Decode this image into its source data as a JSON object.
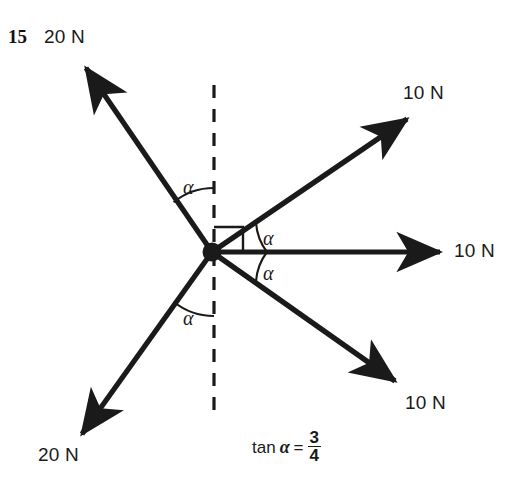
{
  "figure": {
    "question_number": "15",
    "width": 508,
    "height": 484,
    "background": "#ffffff",
    "ink_color": "#1a1a1a",
    "origin": {
      "x": 212,
      "y": 252
    }
  },
  "reference_line": {
    "name": "vertical-dashed-reference",
    "x": 214,
    "y_top": 85,
    "y_bottom": 420,
    "style": "dashed"
  },
  "right_angle_marker": {
    "present": true,
    "size": 28,
    "description": "square marker between vertical dashed line and upper-right 10 N vector"
  },
  "vectors": [
    {
      "id": "upper-left-20n",
      "label": "20 N",
      "magnitude": 20,
      "unit": "N",
      "tip": {
        "x": 80,
        "y": 62
      },
      "label_pos": {
        "x": 44,
        "y": 28
      }
    },
    {
      "id": "upper-right-10n",
      "label": "10 N",
      "magnitude": 10,
      "unit": "N",
      "tip": {
        "x": 412,
        "y": 113
      },
      "label_pos": {
        "x": 405,
        "y": 84
      }
    },
    {
      "id": "right-horizontal-10n",
      "label": "10 N",
      "magnitude": 10,
      "unit": "N",
      "tip": {
        "x": 445,
        "y": 252
      },
      "label_pos": {
        "x": 455,
        "y": 240
      }
    },
    {
      "id": "lower-right-10n",
      "label": "10 N",
      "magnitude": 10,
      "unit": "N",
      "tip": {
        "x": 400,
        "y": 386
      },
      "label_pos": {
        "x": 406,
        "y": 392
      }
    },
    {
      "id": "lower-left-20n",
      "label": "20 N",
      "magnitude": 20,
      "unit": "N",
      "tip": {
        "x": 76,
        "y": 440
      },
      "label_pos": {
        "x": 40,
        "y": 445
      }
    }
  ],
  "angle_labels": [
    {
      "id": "alpha-upper-left",
      "text": "α",
      "pos": {
        "x": 183,
        "y": 176
      }
    },
    {
      "id": "alpha-upper-right",
      "text": "α",
      "pos": {
        "x": 263,
        "y": 227
      }
    },
    {
      "id": "alpha-lower-right",
      "text": "α",
      "pos": {
        "x": 263,
        "y": 262
      }
    },
    {
      "id": "alpha-lower-left",
      "text": "α",
      "pos": {
        "x": 183,
        "y": 307
      }
    }
  ],
  "equation": {
    "text": "tan α = 3/4",
    "lhs": "tan",
    "symbol": "α",
    "equals": "=",
    "numerator": "3",
    "denominator": "4",
    "pos": {
      "x": 252,
      "y": 434
    }
  }
}
